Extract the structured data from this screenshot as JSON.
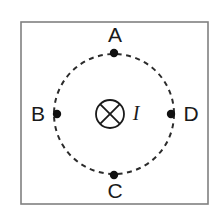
{
  "figure": {
    "canvas": {
      "width": 219,
      "height": 219,
      "background": "#ffffff"
    },
    "frame": {
      "name": "figure-border",
      "x": 21,
      "y": 22,
      "width": 187,
      "height": 182,
      "stroke_color": "#808080",
      "stroke_width": 1.6,
      "fill": "#ffffff"
    },
    "circle": {
      "name": "dashed-field-line",
      "center_x": 114,
      "center_y": 114,
      "radius": 60,
      "stroke_color": "#2b2b2b",
      "stroke_width": 2,
      "dash_pattern": "5 4.5",
      "style": "dashed"
    },
    "center_symbol": {
      "name": "current-into-page-symbol",
      "glyph": "cross-in-circle",
      "center_x": 110,
      "center_y": 114,
      "radius": 14,
      "stroke_color": "#1a1a1a",
      "stroke_width": 1.8
    },
    "current_label": {
      "name": "current-label",
      "text": "I",
      "x": 136,
      "y": 115,
      "color": "#1a1a1a"
    },
    "points": [
      {
        "id": "A",
        "label": "A",
        "dot_x": 114,
        "dot_y": 53,
        "dot_radius": 4.2,
        "label_x": 115,
        "label_y": 36,
        "position": "top",
        "color": "#111111"
      },
      {
        "id": "B",
        "label": "B",
        "dot_x": 57,
        "dot_y": 114,
        "dot_radius": 4.2,
        "label_x": 38,
        "label_y": 115,
        "position": "left",
        "color": "#111111"
      },
      {
        "id": "C",
        "label": "C",
        "dot_x": 114,
        "dot_y": 175,
        "dot_radius": 4.2,
        "label_x": 115,
        "label_y": 192,
        "position": "bottom",
        "color": "#111111"
      },
      {
        "id": "D",
        "label": "D",
        "dot_x": 171,
        "dot_y": 114,
        "dot_radius": 4.2,
        "label_x": 191,
        "label_y": 115,
        "position": "right",
        "color": "#111111"
      }
    ]
  }
}
